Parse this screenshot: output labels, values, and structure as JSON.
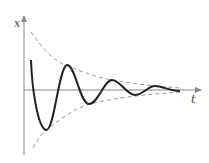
{
  "diagram": {
    "axes": {
      "x_label": "t",
      "y_label": "x"
    },
    "curve": {
      "type": "damped-oscillation",
      "color": "#222222",
      "points": [
        [
          31,
          60
        ],
        [
          45,
          130
        ],
        [
          67,
          65
        ],
        [
          88,
          104
        ],
        [
          112,
          80
        ],
        [
          135,
          95
        ],
        [
          155,
          86
        ],
        [
          180,
          91
        ]
      ]
    },
    "envelope": {
      "style": "dashed",
      "color": "#999999",
      "upper": [
        [
          31,
          32
        ],
        [
          65,
          65
        ],
        [
          112,
          80
        ],
        [
          180,
          88
        ]
      ],
      "lower": [
        [
          33,
          147
        ],
        [
          45,
          130
        ],
        [
          88,
          104
        ],
        [
          180,
          92
        ]
      ]
    },
    "colors": {
      "axis": "#888888",
      "curve": "#222222",
      "envelope": "#999999"
    }
  }
}
